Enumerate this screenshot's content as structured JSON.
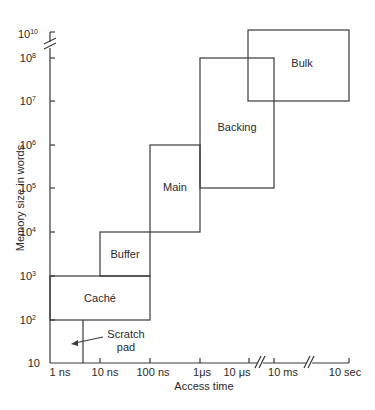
{
  "diagram": {
    "y_axis": {
      "label": "Memory size in words",
      "ticks": [
        {
          "base": "10",
          "exp": "",
          "y": 363
        },
        {
          "base": "10",
          "exp": "2",
          "y": 320
        },
        {
          "base": "10",
          "exp": "3",
          "y": 276
        },
        {
          "base": "10",
          "exp": "4",
          "y": 232
        },
        {
          "base": "10",
          "exp": "5",
          "y": 188
        },
        {
          "base": "10",
          "exp": "6",
          "y": 145
        },
        {
          "base": "10",
          "exp": "7",
          "y": 101
        },
        {
          "base": "10",
          "exp": "8",
          "y": 58
        },
        {
          "base": "10",
          "exp": "10",
          "y": 32
        }
      ]
    },
    "x_axis": {
      "label": "Access time",
      "ticks": [
        {
          "text": "1 ns",
          "x": 50
        },
        {
          "text": "10 ns",
          "x": 100
        },
        {
          "text": "100 ns",
          "x": 150
        },
        {
          "text": "1μs",
          "x": 200
        },
        {
          "text": "10 μs",
          "x": 249
        },
        {
          "text": "10 ms",
          "x": 274
        },
        {
          "text": "10 sec",
          "x": 349
        }
      ]
    },
    "regions": [
      {
        "name": "Caché",
        "x1": 50,
        "y1": 276,
        "x2": 150,
        "y2": 320
      },
      {
        "name": "Buffer",
        "x1": 100,
        "y1": 232,
        "x2": 150,
        "y2": 276
      },
      {
        "name": "Main",
        "x1": 150,
        "y1": 145,
        "x2": 200,
        "y2": 232
      },
      {
        "name": "Backing",
        "x1": 200,
        "y1": 58,
        "x2": 274,
        "y2": 188
      },
      {
        "name": "Bulk",
        "x1": 248,
        "y1": 30,
        "x2": 349,
        "y2": 101
      }
    ],
    "annotation": {
      "line1": "Scratch",
      "line2": "pad"
    },
    "labels": {
      "cache": "Caché",
      "buffer": "Buffer",
      "main": "Main",
      "backing": "Backing",
      "bulk": "Bulk"
    },
    "y_tick_labels": {
      "t10": "10",
      "t100_base": "10",
      "t100_exp": "2",
      "t1k_base": "10",
      "t1k_exp": "3",
      "t10k_base": "10",
      "t10k_exp": "4",
      "t100k_base": "10",
      "t100k_exp": "5",
      "t1m_base": "10",
      "t1m_exp": "6",
      "t10m_base": "10",
      "t10m_exp": "7",
      "t100m_base": "10",
      "t100m_exp": "8",
      "t10b_base": "10",
      "t10b_exp": "10"
    },
    "x_tick_labels": {
      "ns1": "1 ns",
      "ns10": "10 ns",
      "ns100": "100 ns",
      "us1": "1μs",
      "us10": "10 μs",
      "ms10": "10 ms",
      "sec10": "10 sec"
    }
  }
}
